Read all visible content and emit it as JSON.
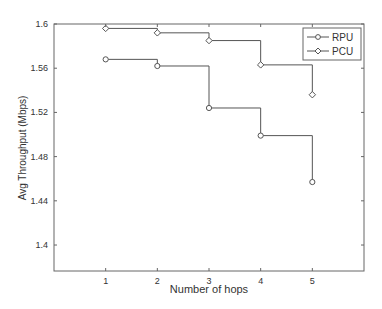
{
  "chart_data": {
    "type": "line",
    "style": "stairs",
    "title": "",
    "xlabel": "Number of hops",
    "ylabel": "Avg Throughput (Mbps)",
    "x": [
      1,
      2,
      3,
      4,
      5
    ],
    "xlim": [
      0,
      6
    ],
    "ylim": [
      1.3765,
      1.6
    ],
    "xticks": [
      1,
      2,
      3,
      4,
      5
    ],
    "xtick_labels": [
      "1",
      "2",
      "3",
      "4",
      "5"
    ],
    "yticks": [
      1.4,
      1.44,
      1.48,
      1.52,
      1.56,
      1.6
    ],
    "ytick_labels": [
      "1.4",
      "1.44",
      "1.48",
      "1.52",
      "1.56",
      "1.6"
    ],
    "grid": false,
    "legend_position": "upper right",
    "series": [
      {
        "name": "RPU",
        "marker": "circle",
        "color": "#555555",
        "values": [
          1.568,
          1.562,
          1.524,
          1.499,
          1.457
        ]
      },
      {
        "name": "PCU",
        "marker": "diamond",
        "color": "#555555",
        "values": [
          1.596,
          1.592,
          1.585,
          1.563,
          1.536
        ]
      }
    ]
  }
}
